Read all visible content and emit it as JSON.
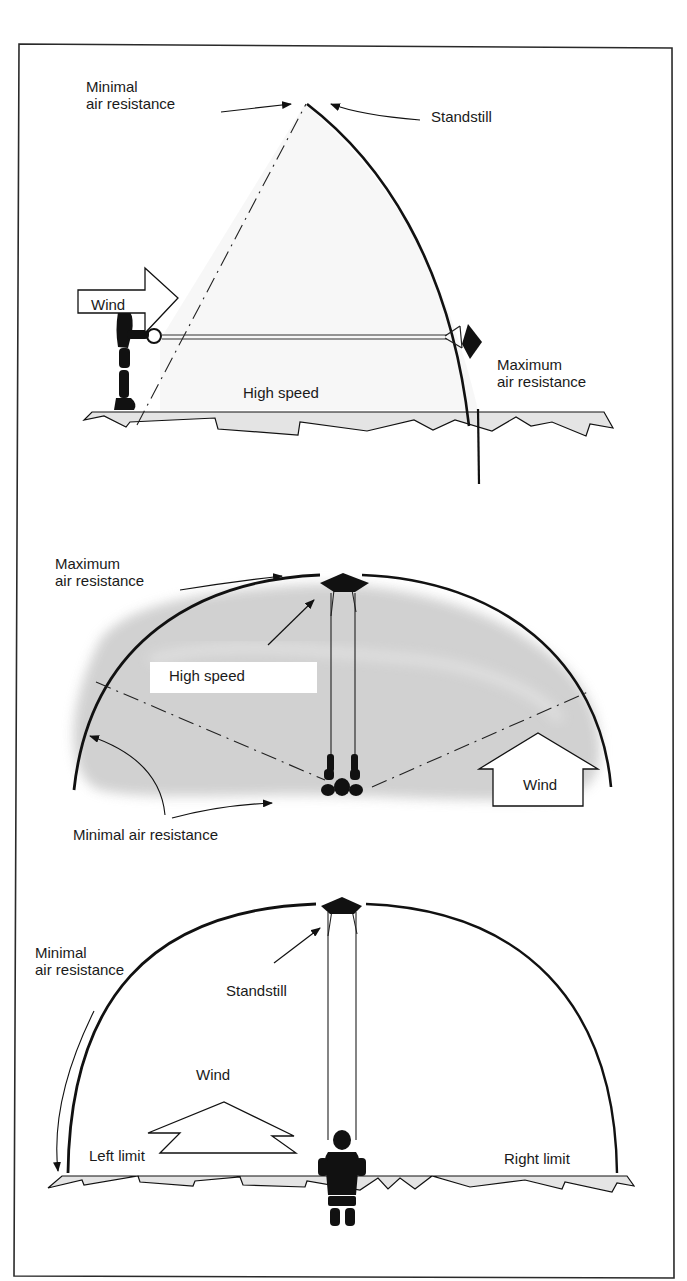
{
  "figure": {
    "colors": {
      "ink": "#111111",
      "frame": "#2a2a2a",
      "ground_fill": "#e4e4e4",
      "sky_shade": "#c8c8c8",
      "background": "#ffffff"
    },
    "panels": [
      {
        "id": "side-view",
        "labels": {
          "minimal_line1": "Minimal",
          "minimal_line2": "air resistance",
          "standstill": "Standstill",
          "wind": "Wind",
          "high_speed": "High speed",
          "maximum_line1": "Maximum",
          "maximum_line2": "air resistance"
        }
      },
      {
        "id": "top-view",
        "labels": {
          "maximum_line1": "Maximum",
          "maximum_line2": "air resistance",
          "high_speed": "High speed",
          "wind": "Wind",
          "minimal": "Minimal air resistance"
        }
      },
      {
        "id": "front-view",
        "labels": {
          "minimal_line1": "Minimal",
          "minimal_line2": "air resistance",
          "standstill": "Standstill",
          "wind": "Wind",
          "left_limit": "Left limit",
          "right_limit": "Right limit"
        }
      }
    ]
  }
}
